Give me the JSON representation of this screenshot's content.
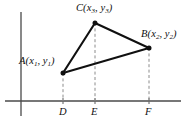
{
  "figure": {
    "caption_hidden": "",
    "background_color": "#ffffff",
    "stroke_color": "#101010",
    "axis_color": "#4a4a4a",
    "dash_color": "#8c8c8c"
  },
  "axes": {
    "x_axis": {
      "name": "horizontal-axis",
      "x1": 5,
      "y1": 101,
      "x2": 181,
      "y2": 101
    },
    "y_axis": {
      "name": "vertical-axis",
      "x1": 21,
      "y1": 12,
      "x2": 21,
      "y2": 116
    }
  },
  "vertices": [
    {
      "id": "A",
      "label_letter": "A",
      "sub_x": "1",
      "sub_y": "1",
      "px": 63,
      "py": 73
    },
    {
      "id": "B",
      "label_letter": "B",
      "sub_x": "2",
      "sub_y": "2",
      "px": 149,
      "py": 48
    },
    {
      "id": "C",
      "label_letter": "C",
      "sub_x": "3",
      "sub_y": "3",
      "px": 95,
      "py": 23
    }
  ],
  "labels": {
    "A": {
      "letter": "A",
      "open": "(",
      "var_x": "x",
      "sub_x": "1",
      "comma": ", ",
      "var_y": "y",
      "sub_y": "1",
      "close": ")"
    },
    "B": {
      "letter": "B",
      "open": "(",
      "var_x": "x",
      "sub_x": "2",
      "comma": ", ",
      "var_y": "y",
      "sub_y": "2",
      "close": ")"
    },
    "C": {
      "letter": "C",
      "open": "(",
      "var_x": "x",
      "sub_x": "3",
      "comma": ", ",
      "var_y": "y",
      "sub_y": "3",
      "close": ")"
    },
    "D": "D",
    "E": "E",
    "F": "F"
  },
  "foot_points": [
    {
      "id": "D",
      "label": "D",
      "px": 63,
      "tick_y_top": 98,
      "tick_y_bottom": 104
    },
    {
      "id": "E",
      "label": "E",
      "px": 95,
      "tick_y_top": 98,
      "tick_y_bottom": 104
    },
    {
      "id": "F",
      "label": "F",
      "px": 149,
      "tick_y_top": 98,
      "tick_y_bottom": 104
    }
  ],
  "dashed_drops": [
    {
      "from": "A",
      "to": "D",
      "x": 63,
      "y_top": 73,
      "y_bottom": 101
    },
    {
      "from": "C",
      "to": "E",
      "x": 95,
      "y_top": 23,
      "y_bottom": 101
    },
    {
      "from": "B",
      "to": "F",
      "x": 149,
      "y_top": 48,
      "y_bottom": 101
    }
  ],
  "triangle_edges": [
    {
      "from": "A",
      "to": "C"
    },
    {
      "from": "C",
      "to": "B"
    },
    {
      "from": "A",
      "to": "B"
    }
  ]
}
